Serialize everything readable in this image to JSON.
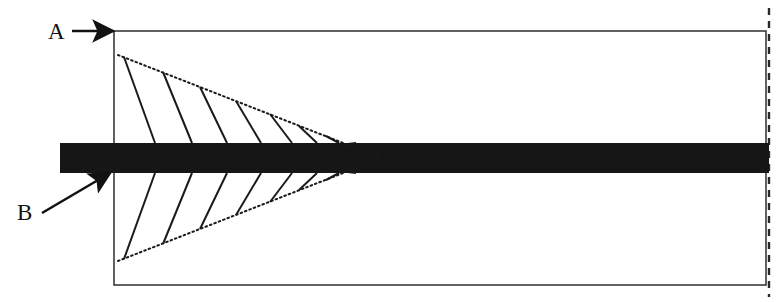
{
  "figure": {
    "title": "",
    "caption": "",
    "background_color": "#ffffff",
    "ink_color": "#1a1a1a",
    "bar_color": "#161616",
    "frame_color": "#3a3a3a",
    "labels": [
      {
        "id": "label-a",
        "text": "A",
        "x": 48,
        "y": 39,
        "font_size": 23,
        "points_to": "frame-top-left-corner",
        "arrow": {
          "type": "straight-horizontal",
          "from_x": 72,
          "from_y": 31,
          "to_x": 113,
          "to_y": 31
        }
      },
      {
        "id": "label-b",
        "text": "B",
        "x": 17,
        "y": 220,
        "font_size": 23,
        "points_to": "bar-lower-left-edge",
        "arrow": {
          "type": "straight-diagonal",
          "from_x": 42,
          "from_y": 213,
          "to_x": 110,
          "to_y": 173
        }
      }
    ],
    "frame": {
      "name": "outer-rectangle",
      "x": 114,
      "y": 31,
      "width": 652,
      "height": 254,
      "stroke_width": 1.6,
      "style": "solid"
    },
    "right_dashed_line": {
      "name": "right-boundary-dashed-line",
      "x": 769,
      "y_top": 8,
      "y_bottom": 297,
      "style": "dashed",
      "dash_pattern": "7,6",
      "stroke_width": 2.4
    },
    "bar": {
      "name": "horizontal-dark-bar",
      "x": 60,
      "y": 143,
      "width": 709,
      "height": 30,
      "fill": "#161616"
    },
    "wedge_apex": {
      "x": 379,
      "y": 158
    },
    "upper_wedge": {
      "name": "upper-dotted-wedge",
      "style": "dotted",
      "start_x": 118,
      "start_y": 55,
      "apex_x": 379,
      "apex_y": 157,
      "hatch_line_count": 8,
      "hatch_style": "solid",
      "hatch_lines": [
        {
          "top_x": 124,
          "top_y": 57,
          "bottom_x": 155,
          "bottom_y": 143
        },
        {
          "top_x": 163,
          "top_y": 72,
          "bottom_x": 192,
          "bottom_y": 143
        },
        {
          "top_x": 200,
          "top_y": 87,
          "bottom_x": 227,
          "bottom_y": 143
        },
        {
          "top_x": 236,
          "top_y": 101,
          "bottom_x": 261,
          "bottom_y": 143
        },
        {
          "top_x": 270,
          "top_y": 114,
          "bottom_x": 292,
          "bottom_y": 143
        },
        {
          "top_x": 299,
          "top_y": 126,
          "bottom_x": 317,
          "bottom_y": 143
        },
        {
          "top_x": 326,
          "top_y": 136,
          "bottom_x": 339,
          "bottom_y": 143
        },
        {
          "top_x": 348,
          "top_y": 144,
          "bottom_x": 356,
          "bottom_y": 143
        }
      ]
    },
    "lower_wedge": {
      "name": "lower-dotted-wedge",
      "style": "dotted",
      "start_x": 118,
      "start_y": 261,
      "apex_x": 379,
      "apex_y": 159,
      "hatch_line_count": 8,
      "hatch_style": "solid",
      "hatch_lines": [
        {
          "bottom_x": 124,
          "bottom_y": 259,
          "top_x": 155,
          "top_y": 173
        },
        {
          "bottom_x": 163,
          "bottom_y": 244,
          "top_x": 192,
          "top_y": 173
        },
        {
          "bottom_x": 200,
          "bottom_y": 229,
          "top_x": 227,
          "top_y": 173
        },
        {
          "bottom_x": 236,
          "bottom_y": 215,
          "top_x": 261,
          "top_y": 173
        },
        {
          "bottom_x": 270,
          "bottom_y": 202,
          "top_x": 292,
          "top_y": 173
        },
        {
          "bottom_x": 299,
          "bottom_y": 190,
          "top_x": 317,
          "top_y": 173
        },
        {
          "bottom_x": 326,
          "bottom_y": 180,
          "top_x": 339,
          "top_y": 173
        },
        {
          "bottom_x": 348,
          "bottom_y": 172,
          "top_x": 356,
          "top_y": 173
        }
      ]
    }
  }
}
